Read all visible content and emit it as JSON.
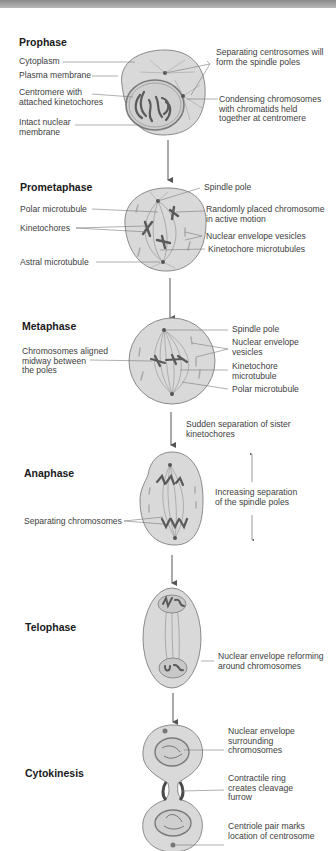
{
  "stages": [
    {
      "title": "Prophase",
      "labels_left": [
        "Cytoplasm",
        "Plasma membrane",
        "Centromere with\nattached kinetochores",
        "Intact nuclear\nmembrane"
      ],
      "labels_right": [
        "Separating centrosomes will\nform the spindle poles",
        "Condensing chromosomes\nwith chromatids held\ntogether at centromere"
      ]
    },
    {
      "title": "Prometaphase",
      "labels_left": [
        "Polar microtubule",
        "Kinetochores",
        "Astral microtubule"
      ],
      "labels_right": [
        "Spindle pole",
        "Randomly placed chromosome\nin active motion",
        "Nuclear envelope vesicles",
        "Kinetochore microtubules"
      ]
    },
    {
      "title": "Metaphase",
      "labels_left": [
        "Chromosomes aligned\nmidway between\nthe poles"
      ],
      "labels_right": [
        "Spindle pole",
        "Nuclear envelope\nvesicles",
        "Kinetochore\nmicrotubule",
        "Polar microtubule"
      ]
    },
    {
      "title": "Anaphase",
      "transition_label": "Sudden separation of sister\nkinetochores",
      "labels_left": [
        "Separating chromosomes"
      ],
      "labels_right": [
        "Increasing separation\nof the spindle poles"
      ]
    },
    {
      "title": "Telophase",
      "labels_left": [],
      "labels_right": [
        "Nuclear envelope reforming\naround chromosomes"
      ]
    },
    {
      "title": "Cytokinesis",
      "labels_left": [],
      "labels_right": [
        "Nuclear envelope\nsurrounding\nchromosomes",
        "Contractile ring\ncreates cleavage\nfurrow",
        "Centriole pair marks\nlocation of centrosome"
      ]
    }
  ],
  "colors": {
    "cell_fill": "#d9d9d9",
    "cell_stroke": "#8a8a8a",
    "chromosome": "#5a5a5a",
    "line": "#7a7a7a",
    "arrow": "#555555"
  }
}
